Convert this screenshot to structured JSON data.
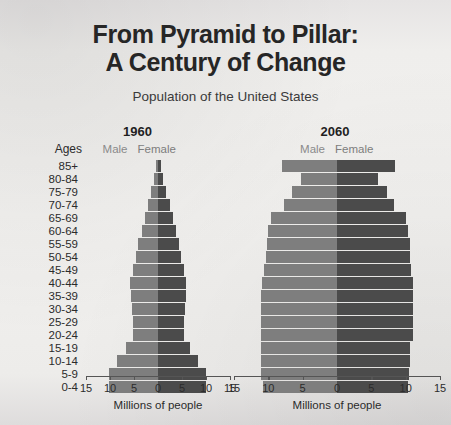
{
  "header": {
    "title_line1": "From Pyramid to Pillar:",
    "title_line2": "A Century of Change",
    "subtitle": "Population of the United States"
  },
  "labels": {
    "ages_header": "Ages",
    "male": "Male",
    "female": "Female",
    "axis_title": "Millions of people"
  },
  "colors": {
    "male_bar": "#7e7e7e",
    "female_bar": "#4b4b4b",
    "background": "#eceaea",
    "text": "#2b2b2b",
    "legend_text": "#8a8a8a"
  },
  "chart_data": {
    "type": "bar",
    "title": "From Pyramid to Pillar: A Century of Change",
    "subtitle": "Population of the United States",
    "xlabel": "Millions of people",
    "ylabel": "Ages",
    "xlim": [
      -15,
      15
    ],
    "xticks": [
      15,
      10,
      5,
      0,
      5,
      10,
      15
    ],
    "grid": false,
    "legend_position": "top-center",
    "categories": [
      "85+",
      "80-84",
      "75-79",
      "70-74",
      "65-69",
      "60-64",
      "55-59",
      "50-54",
      "45-49",
      "40-44",
      "35-39",
      "30-34",
      "25-29",
      "20-24",
      "15-19",
      "10-14",
      "5-9",
      "0-4"
    ],
    "panels": [
      {
        "year": "1960",
        "series": [
          {
            "name": "Male",
            "values": [
              0.5,
              0.9,
              1.4,
              2.1,
              2.7,
              3.4,
              4.1,
              4.6,
              5.3,
              5.8,
              5.6,
              5.4,
              5.3,
              5.3,
              6.6,
              8.5,
              10.3,
              10.3
            ]
          },
          {
            "name": "Female",
            "values": [
              0.7,
              1.1,
              1.7,
              2.4,
              3.1,
              3.8,
              4.4,
              4.8,
              5.5,
              5.9,
              5.8,
              5.6,
              5.5,
              5.5,
              6.6,
              8.3,
              9.9,
              9.9
            ]
          }
        ]
      },
      {
        "year": "2060",
        "series": [
          {
            "name": "Male",
            "values": [
              8.0,
              5.3,
              6.6,
              7.7,
              9.6,
              10.0,
              10.2,
              10.4,
              10.6,
              10.9,
              11.0,
              11.1,
              11.1,
              11.1,
              11.0,
              11.0,
              11.0,
              10.8
            ]
          },
          {
            "name": "Female",
            "values": [
              8.5,
              6.0,
              7.3,
              8.3,
              10.0,
              10.4,
              10.6,
              10.7,
              10.8,
              11.0,
              11.1,
              11.1,
              11.1,
              11.0,
              10.6,
              10.6,
              10.5,
              10.3
            ]
          }
        ]
      }
    ]
  }
}
